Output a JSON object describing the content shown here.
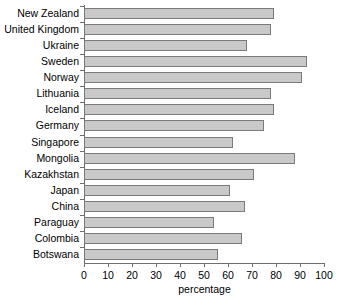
{
  "chart_data": {
    "type": "bar",
    "orientation": "horizontal",
    "title": "",
    "xlabel": "percentage",
    "ylabel": "",
    "xlim": [
      0,
      100
    ],
    "xticks": [
      0,
      10,
      20,
      30,
      40,
      50,
      60,
      70,
      80,
      90,
      100
    ],
    "grid": false,
    "legend": null,
    "bar_color": "#c9c9c9",
    "bar_edge_color": "#7a7a7a",
    "axis_color": "#6e6e6e",
    "categories": [
      "New Zealand",
      "United Kingdom",
      "Ukraine",
      "Sweden",
      "Norway",
      "Lithuania",
      "Iceland",
      "Germany",
      "Singapore",
      "Mongolia",
      "Kazakhstan",
      "Japan",
      "China",
      "Paraguay",
      "Colombia",
      "Botswana"
    ],
    "values": [
      79,
      78,
      68,
      93,
      91,
      78,
      79,
      75,
      62,
      88,
      71,
      61,
      67,
      54,
      66,
      56
    ]
  }
}
